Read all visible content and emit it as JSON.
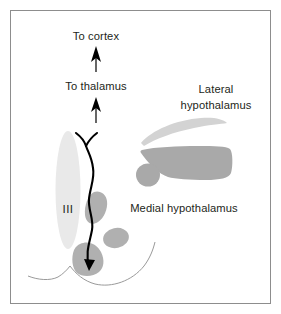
{
  "figure": {
    "background_color": "#ffffff",
    "frame_color": "#8d8d8d",
    "width": 281,
    "height": 314
  },
  "labels": {
    "to_cortex": "To cortex",
    "to_thalamus": "To thalamus",
    "lateral_line1": "Lateral",
    "lateral_line2": "hypothalamus",
    "medial": "Medial hypothalamus",
    "third_ventricle": "III"
  },
  "colors": {
    "text": "#231f20",
    "pathway_stroke": "#000000",
    "arrow_fill": "#000000",
    "ventricle_fill": "#e9e9e9",
    "light_gray_fill": "#d3d3d3",
    "mid_gray_fill": "#a9a9a9",
    "nucleus_gray_fill": "#b0b0b0",
    "outline_stroke": "#9a9a9a"
  },
  "structures": [
    {
      "name": "third-ventricle",
      "shape": "ellipse",
      "fill": "#e9e9e9"
    },
    {
      "name": "lateral-hypothalamus-crescent",
      "shape": "crescent",
      "fill": "#d3d3d3"
    },
    {
      "name": "lateral-hypothalamus-body",
      "shape": "blob",
      "fill": "#a9a9a9"
    },
    {
      "name": "lateral-hypothalamus-circle",
      "shape": "circle",
      "fill": "#a9a9a9"
    },
    {
      "name": "medial-nucleus-upper",
      "shape": "blob",
      "fill": "#b0b0b0"
    },
    {
      "name": "medial-nucleus-lower",
      "shape": "ellipse",
      "fill": "#b0b0b0"
    },
    {
      "name": "mammillary-body",
      "shape": "blob",
      "fill": "#b0b0b0"
    },
    {
      "name": "brain-base-outline",
      "shape": "curve",
      "stroke": "#9a9a9a"
    },
    {
      "name": "ascending-pathway",
      "shape": "path",
      "stroke": "#000000"
    },
    {
      "name": "arrow-to-cortex",
      "shape": "arrow",
      "fill": "#000000"
    },
    {
      "name": "arrow-to-thalamus",
      "shape": "arrow",
      "fill": "#000000"
    }
  ]
}
